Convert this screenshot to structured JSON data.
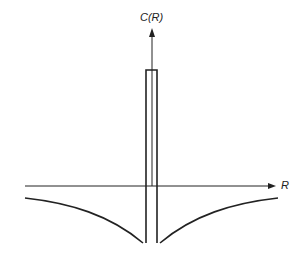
{
  "diagram": {
    "y_axis_label": "C(R)",
    "x_axis_label": "R",
    "line_color": "#222222"
  }
}
